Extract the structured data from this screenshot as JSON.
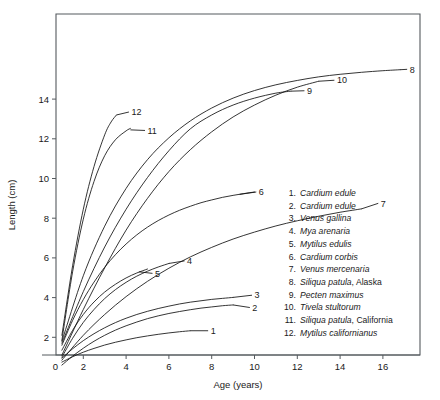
{
  "chart_data": {
    "type": "line",
    "title": "",
    "xlabel": "Age (years)",
    "ylabel": "Length (cm)",
    "xlim": [
      0,
      17.6
    ],
    "ylim": [
      0,
      15.9
    ],
    "xticks": [
      0,
      2,
      4,
      6,
      8,
      10,
      12,
      14,
      16
    ],
    "yticks": [
      2,
      4,
      6,
      8,
      10,
      12,
      14
    ],
    "grid": false,
    "legend_position": "inside-right",
    "series": [
      {
        "name": "1",
        "label": "1",
        "legend_species": "Cardium edule",
        "legend_locality": "",
        "x": [
          1.0,
          1.5,
          2.0,
          2.5,
          3.0,
          3.5,
          4.0,
          4.5,
          5.0,
          5.5,
          6.0,
          6.5,
          7.0
        ],
        "y": [
          0.75,
          1.02,
          1.25,
          1.44,
          1.61,
          1.75,
          1.87,
          1.98,
          2.07,
          2.15,
          2.22,
          2.28,
          2.33
        ],
        "label_at": [
          7.0,
          2.33
        ],
        "label_text_xy": [
          7.95,
          2.33
        ]
      },
      {
        "name": "2",
        "label": "2",
        "legend_species": "Cardium edule",
        "legend_locality": "",
        "x": [
          1.0,
          1.5,
          2.0,
          2.5,
          3.0,
          3.5,
          4.0,
          4.5,
          5.0,
          5.5,
          6.0,
          6.5,
          7.0,
          7.5,
          8.0,
          8.5,
          9.0
        ],
        "y": [
          0.6,
          1.05,
          1.45,
          1.8,
          2.1,
          2.36,
          2.58,
          2.77,
          2.94,
          3.08,
          3.2,
          3.3,
          3.39,
          3.47,
          3.53,
          3.59,
          3.63
        ],
        "label_at": [
          9.0,
          3.63
        ],
        "label_text_xy": [
          9.9,
          3.5
        ]
      },
      {
        "name": "3",
        "label": "3",
        "legend_species": "Venus gallina",
        "legend_locality": "",
        "x": [
          1.0,
          1.5,
          2.0,
          2.5,
          3.0,
          3.5,
          4.0,
          4.5,
          5.0,
          5.5,
          6.0,
          6.5,
          7.0,
          7.5,
          8.0,
          8.5,
          9.0
        ],
        "y": [
          0.95,
          1.42,
          1.83,
          2.18,
          2.48,
          2.74,
          2.96,
          3.15,
          3.31,
          3.45,
          3.57,
          3.68,
          3.77,
          3.84,
          3.91,
          3.96,
          4.01
        ],
        "label_at": [
          9.0,
          4.01
        ],
        "label_text_xy": [
          10.0,
          4.12
        ]
      },
      {
        "name": "4",
        "label": "4",
        "legend_species": "Mya arenaria",
        "legend_locality": "",
        "x": [
          1.0,
          1.5,
          2.0,
          2.5,
          3.0,
          3.5,
          4.0,
          4.5,
          5.0,
          5.5,
          6.0
        ],
        "y": [
          1.0,
          1.95,
          2.75,
          3.4,
          3.95,
          4.4,
          4.77,
          5.08,
          5.33,
          5.54,
          5.72
        ],
        "label_at": [
          6.0,
          5.72
        ],
        "label_text_xy": [
          6.85,
          5.85
        ]
      },
      {
        "name": "5",
        "label": "5",
        "legend_species": "Mytilus edulis",
        "legend_locality": "",
        "x": [
          1.0,
          1.5,
          2.0,
          2.5,
          3.0,
          3.5,
          4.0,
          4.5,
          5.0
        ],
        "y": [
          1.35,
          2.35,
          3.15,
          3.78,
          4.28,
          4.67,
          4.99,
          5.24,
          5.44
        ],
        "label_at": [
          4.6,
          5.3
        ],
        "label_text_xy": [
          5.35,
          5.22
        ]
      },
      {
        "name": "6",
        "label": "6",
        "legend_species": "Cardium corbis",
        "legend_locality": "",
        "x": [
          1.0,
          1.5,
          2.0,
          2.5,
          3.0,
          3.5,
          4.0,
          4.5,
          5.0,
          5.5,
          6.0,
          6.5,
          7.0,
          7.5,
          8.0,
          8.5,
          9.0,
          9.5,
          10.0
        ],
        "y": [
          1.6,
          2.85,
          3.9,
          4.78,
          5.53,
          6.16,
          6.7,
          7.16,
          7.55,
          7.88,
          8.16,
          8.4,
          8.6,
          8.78,
          8.92,
          9.05,
          9.15,
          9.24,
          9.32
        ],
        "label_at": [
          9.3,
          9.2
        ],
        "label_text_xy": [
          10.2,
          9.32
        ]
      },
      {
        "name": "7",
        "label": "7",
        "legend_species": "Venus mercenaria",
        "legend_locality": "",
        "x": [
          1.0,
          2.0,
          3.0,
          4.0,
          5.0,
          6.0,
          7.0,
          8.0,
          9.0,
          10.0,
          11.0,
          12.0,
          13.0,
          14.0,
          15.0
        ],
        "y": [
          0.85,
          2.1,
          3.15,
          4.05,
          4.82,
          5.48,
          6.05,
          6.53,
          6.95,
          7.3,
          7.61,
          7.87,
          8.1,
          8.3,
          8.47
        ],
        "label_at": [
          15.0,
          8.47
        ],
        "label_text_xy": [
          15.9,
          8.75
        ]
      },
      {
        "name": "8",
        "label": "8",
        "legend_species": "Siliqua patula",
        "legend_locality": ", Alaska",
        "x": [
          1.0,
          2.0,
          3.0,
          4.0,
          5.0,
          6.0,
          7.0,
          8.0,
          9.0,
          10.0,
          11.0,
          12.0,
          13.0,
          14.0,
          15.0,
          16.0,
          16.8
        ],
        "y": [
          1.8,
          5.1,
          7.6,
          9.5,
          10.95,
          12.05,
          12.9,
          13.55,
          14.05,
          14.43,
          14.72,
          14.94,
          15.12,
          15.25,
          15.35,
          15.43,
          15.48
        ],
        "label_at": [
          16.8,
          15.48
        ],
        "label_text_xy": [
          17.25,
          15.5
        ]
      },
      {
        "name": "9",
        "label": "9",
        "legend_species": "Pecten maximus",
        "legend_locality": "",
        "x": [
          1.0,
          2.0,
          3.0,
          4.0,
          5.0,
          6.0,
          7.0,
          8.0,
          9.0,
          10.0,
          11.0,
          11.7
        ],
        "y": [
          1.7,
          4.3,
          6.55,
          8.45,
          10.05,
          11.4,
          12.5,
          13.2,
          13.7,
          14.05,
          14.3,
          14.4
        ],
        "label_at": [
          11.7,
          14.4
        ],
        "label_text_xy": [
          12.45,
          14.42
        ]
      },
      {
        "name": "10",
        "label": "10",
        "legend_species": "Tivela stultorum",
        "legend_locality": "",
        "x": [
          1.0,
          2.0,
          3.0,
          4.0,
          5.0,
          6.0,
          7.0,
          8.0,
          9.0,
          10.0,
          11.0,
          12.0,
          13.0
        ],
        "y": [
          1.1,
          3.4,
          5.5,
          7.4,
          9.0,
          10.35,
          11.45,
          12.35,
          13.1,
          13.7,
          14.2,
          14.6,
          14.9
        ],
        "label_at": [
          13.0,
          14.9
        ],
        "label_text_xy": [
          13.85,
          14.95
        ]
      },
      {
        "name": "11",
        "label": "11",
        "legend_species": "Siliqua patula",
        "legend_locality": ", California",
        "x": [
          1.0,
          1.5,
          2.0,
          2.5,
          3.0,
          3.5,
          4.0,
          4.2
        ],
        "y": [
          1.85,
          5.3,
          7.95,
          9.85,
          11.15,
          11.95,
          12.4,
          12.52
        ],
        "label_at": [
          4.2,
          12.45
        ],
        "label_text_xy": [
          5.0,
          12.42
        ]
      },
      {
        "name": "12",
        "label": "12",
        "legend_species": "Mytilus californianus",
        "legend_locality": "",
        "x": [
          1.0,
          1.5,
          2.0,
          2.5,
          3.0,
          3.3,
          3.55
        ],
        "y": [
          2.1,
          5.6,
          8.45,
          10.6,
          12.2,
          12.85,
          13.2
        ],
        "label_at": [
          3.55,
          13.2
        ],
        "label_text_xy": [
          4.25,
          13.35
        ]
      }
    ],
    "legend_entries": [
      {
        "num": "1.",
        "species": "Cardium edule",
        "locality": ""
      },
      {
        "num": "2.",
        "species": "Cardium edule",
        "locality": ""
      },
      {
        "num": "3.",
        "species": "Venus gallina",
        "locality": ""
      },
      {
        "num": "4.",
        "species": "Mya arenaria",
        "locality": ""
      },
      {
        "num": "5.",
        "species": "Mytilus edulis",
        "locality": ""
      },
      {
        "num": "6.",
        "species": "Cardium corbis",
        "locality": ""
      },
      {
        "num": "7.",
        "species": "Venus mercenaria",
        "locality": ""
      },
      {
        "num": "8.",
        "species": "Siliqua patula",
        "locality": ", Alaska"
      },
      {
        "num": "9.",
        "species": "Pecten maximus",
        "locality": ""
      },
      {
        "num": "10.",
        "species": "Tivela stultorum",
        "locality": ""
      },
      {
        "num": "11.",
        "species": "Siliqua patula",
        "locality": ", California"
      },
      {
        "num": "12.",
        "species": "Mytilus californianus",
        "locality": ""
      }
    ]
  },
  "style": {
    "line_color": "#111111",
    "frame_color": "#555a5e",
    "background": "#ffffff"
  }
}
